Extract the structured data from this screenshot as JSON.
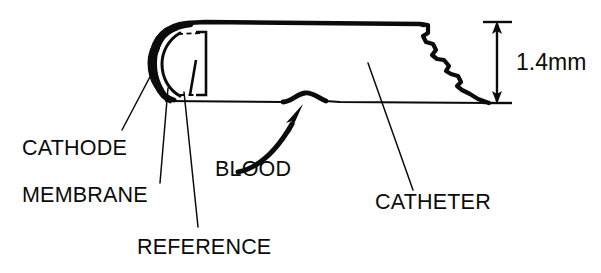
{
  "figure": {
    "background_color": "#ffffff",
    "ink_color": "#0b0b0b",
    "width": 601,
    "height": 273
  },
  "dimension": {
    "value": "1.4mm",
    "orientation": "vertical",
    "measures": "catheter outer diameter"
  },
  "labels": {
    "cathode": "CATHODE",
    "membrane": "MEMBRANE",
    "reference": "REFERENCE",
    "blood": "BLOOD",
    "catheter": "CATHETER"
  },
  "parts": [
    {
      "name": "cathode",
      "label": "CATHODE",
      "description": "solid black crescent at the rounded tip"
    },
    {
      "name": "membrane",
      "label": "MEMBRANE",
      "description": "outer dome shell covering the tip"
    },
    {
      "name": "reference",
      "label": "REFERENCE",
      "description": "inner bracket electrode behind the tip"
    },
    {
      "name": "blood",
      "label": "BLOOD",
      "description": "curved arrow showing flow entering the catheter wall"
    },
    {
      "name": "catheter",
      "label": "CATHETER",
      "description": "tubular body with broken-away right end"
    }
  ]
}
